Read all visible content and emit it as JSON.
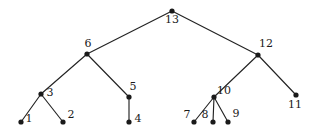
{
  "figure": {
    "kind": "rooted-tree-diagram",
    "background_color": "#ffffff",
    "node_color": "#1a1a1a",
    "edge_color": "#232323",
    "label_color": "#1a1a1a",
    "width": 320,
    "height": 133
  },
  "nodes": [
    {
      "id": "n13",
      "label": "13",
      "x": 172,
      "y": 11,
      "lx": 172,
      "ly": 23,
      "anchor": "middle"
    },
    {
      "id": "n6",
      "label": "6",
      "x": 87,
      "y": 54,
      "lx": 88,
      "ly": 47,
      "anchor": "middle"
    },
    {
      "id": "n12",
      "label": "12",
      "x": 258,
      "y": 55,
      "lx": 266,
      "ly": 47,
      "anchor": "middle"
    },
    {
      "id": "n3",
      "label": "3",
      "x": 41,
      "y": 94,
      "lx": 50,
      "ly": 96,
      "anchor": "middle"
    },
    {
      "id": "n5",
      "label": "5",
      "x": 129,
      "y": 97,
      "lx": 133,
      "ly": 90,
      "anchor": "middle"
    },
    {
      "id": "n10",
      "label": "10",
      "x": 214,
      "y": 97,
      "lx": 224,
      "ly": 94,
      "anchor": "middle"
    },
    {
      "id": "n11",
      "label": "11",
      "x": 296,
      "y": 95,
      "lx": 295,
      "ly": 108,
      "anchor": "middle"
    },
    {
      "id": "n1",
      "label": "1",
      "x": 21,
      "y": 122,
      "lx": 29,
      "ly": 122,
      "anchor": "middle"
    },
    {
      "id": "n2",
      "label": "2",
      "x": 63,
      "y": 122,
      "lx": 71,
      "ly": 118,
      "anchor": "middle"
    },
    {
      "id": "n4",
      "label": "4",
      "x": 129,
      "y": 122,
      "lx": 138,
      "ly": 122,
      "anchor": "middle"
    },
    {
      "id": "n7",
      "label": "7",
      "x": 194,
      "y": 122,
      "lx": 187,
      "ly": 118,
      "anchor": "middle"
    },
    {
      "id": "n8",
      "label": "8",
      "x": 213,
      "y": 122,
      "lx": 205,
      "ly": 118,
      "anchor": "middle"
    },
    {
      "id": "n9",
      "label": "9",
      "x": 228,
      "y": 122,
      "lx": 236,
      "ly": 117,
      "anchor": "middle"
    }
  ],
  "edges": [
    {
      "id": "e13-6",
      "from": "13",
      "to": "6",
      "x1": 172,
      "y1": 11,
      "x2": 87,
      "y2": 54
    },
    {
      "id": "e13-12",
      "from": "13",
      "to": "12",
      "x1": 172,
      "y1": 11,
      "x2": 258,
      "y2": 55
    },
    {
      "id": "e6-3",
      "from": "6",
      "to": "3",
      "x1": 87,
      "y1": 54,
      "x2": 41,
      "y2": 94
    },
    {
      "id": "e6-5",
      "from": "6",
      "to": "5",
      "x1": 87,
      "y1": 54,
      "x2": 129,
      "y2": 97
    },
    {
      "id": "e3-1",
      "from": "3",
      "to": "1",
      "x1": 41,
      "y1": 94,
      "x2": 21,
      "y2": 122
    },
    {
      "id": "e3-2",
      "from": "3",
      "to": "2",
      "x1": 41,
      "y1": 94,
      "x2": 63,
      "y2": 122
    },
    {
      "id": "e5-4",
      "from": "5",
      "to": "4",
      "x1": 129,
      "y1": 97,
      "x2": 129,
      "y2": 122
    },
    {
      "id": "e12-10",
      "from": "12",
      "to": "10",
      "x1": 258,
      "y1": 55,
      "x2": 214,
      "y2": 97
    },
    {
      "id": "e12-11",
      "from": "12",
      "to": "11",
      "x1": 258,
      "y1": 55,
      "x2": 296,
      "y2": 95
    },
    {
      "id": "e10-7",
      "from": "10",
      "to": "7",
      "x1": 214,
      "y1": 97,
      "x2": 194,
      "y2": 122
    },
    {
      "id": "e10-8",
      "from": "10",
      "to": "8",
      "x1": 214,
      "y1": 97,
      "x2": 213,
      "y2": 122
    },
    {
      "id": "e10-9",
      "from": "10",
      "to": "9",
      "x1": 214,
      "y1": 97,
      "x2": 228,
      "y2": 122
    }
  ],
  "node_radius": 2.6
}
